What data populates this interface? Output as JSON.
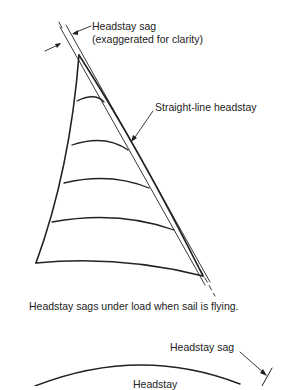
{
  "diagram": {
    "top_figure": {
      "label_sag_line1": "Headstay sag",
      "label_sag_line2": "(exaggerated for clarity)",
      "label_straight": "Straight-line headstay",
      "caption": "Headstay sags under load when sail is flying."
    },
    "bottom_figure": {
      "label_sag": "Headstay sag",
      "label_headstay_partial": "Headstay"
    },
    "colors": {
      "line": "#222222",
      "background": "#ffffff"
    }
  }
}
